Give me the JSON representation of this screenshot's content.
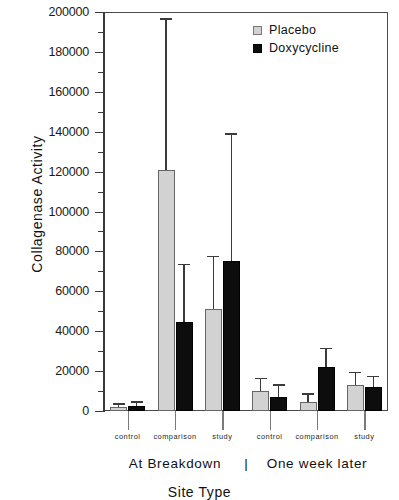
{
  "chart_data": {
    "type": "bar",
    "title": "",
    "xlabel": "Site Type",
    "ylabel": "Collagenase Activity",
    "ylim": [
      0,
      200000
    ],
    "ytick_step": 20000,
    "yminor_step": 10000,
    "grid": false,
    "legend_position": "top-right",
    "categories": [
      "control",
      "comparison",
      "study",
      "control",
      "comparison",
      "study"
    ],
    "group_labels": [
      "At Breakdown",
      "One week later"
    ],
    "group_separator": "|",
    "yticks": [
      {
        "value": 200000,
        "label": "200000"
      },
      {
        "value": 180000,
        "label": "180000"
      },
      {
        "value": 160000,
        "label": "160000"
      },
      {
        "value": 140000,
        "label": "140000"
      },
      {
        "value": 120000,
        "label": "120000"
      },
      {
        "value": 100000,
        "label": "100000"
      },
      {
        "value": 80000,
        "label": "80000"
      },
      {
        "value": 60000,
        "label": "60000"
      },
      {
        "value": 40000,
        "label": "40000"
      },
      {
        "value": 20000,
        "label": "20000"
      },
      {
        "value": 0,
        "label": "0"
      }
    ],
    "series": [
      {
        "name": "Placebo",
        "color": "#d2d2d2",
        "values": [
          2000,
          121000,
          51000,
          10000,
          4500,
          13000
        ],
        "errors_upper": [
          3000,
          196000,
          77000,
          16000,
          8000,
          19000
        ]
      },
      {
        "name": "Doxycycline",
        "color": "#0d0d0d",
        "values": [
          2500,
          44500,
          75000,
          7000,
          22000,
          12000
        ],
        "errors_upper": [
          4000,
          73000,
          138500,
          12500,
          31000,
          17000
        ]
      }
    ]
  },
  "legend": {
    "items": [
      {
        "label": "Placebo",
        "swatch": "placebo"
      },
      {
        "label": "Doxycycline",
        "swatch": "doxy"
      }
    ]
  }
}
